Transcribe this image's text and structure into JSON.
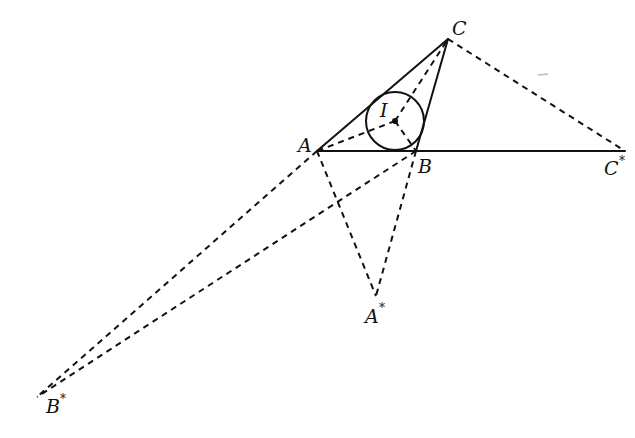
{
  "diagram": {
    "type": "geometry",
    "points": {
      "A": {
        "label": "A",
        "x": 317,
        "y": 151
      },
      "B": {
        "label": "B",
        "x": 416,
        "y": 151
      },
      "C": {
        "label": "C",
        "x": 448,
        "y": 39
      },
      "I": {
        "label": "I",
        "x": 395,
        "y": 121
      },
      "A_star": {
        "label": "A",
        "sup": "*",
        "x": 376,
        "y": 296
      },
      "B_star": {
        "label": "B",
        "sup": "*",
        "x": 37,
        "y": 397
      },
      "C_star": {
        "label": "C",
        "sup": "*",
        "x": 625,
        "y": 151
      }
    },
    "incircle": {
      "center": "I",
      "radius": 29
    },
    "solid_segments": [
      [
        "A",
        "C"
      ],
      [
        "C",
        "B"
      ],
      [
        "A",
        "C_star"
      ]
    ],
    "dashed_segments": [
      [
        "C",
        "C_star"
      ],
      [
        "A",
        "B_star"
      ],
      [
        "B",
        "B_star"
      ],
      [
        "A",
        "A_star"
      ],
      [
        "B",
        "A_star"
      ],
      [
        "I",
        "A"
      ],
      [
        "I",
        "B"
      ],
      [
        "I",
        "C"
      ]
    ],
    "labels": {
      "A": "A",
      "B": "B",
      "C": "C",
      "I": "I",
      "A_star": "A",
      "B_star": "B",
      "C_star": "C",
      "star": "*"
    }
  }
}
